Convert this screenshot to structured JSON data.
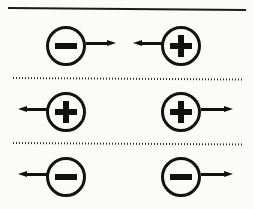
{
  "figure": {
    "background_color": "#fbfbfa",
    "ink_color": "#111111",
    "dividers": [
      {
        "style": "solid",
        "label": "top-solid-rule"
      },
      {
        "style": "dotted",
        "label": "dotted-rule-1"
      },
      {
        "style": "dotted",
        "label": "dotted-rule-2"
      }
    ],
    "rows": [
      {
        "id": "row-attraction",
        "interaction": "attraction",
        "left": {
          "charge": "negative",
          "sign_glyph": "−",
          "arrow_direction": "right",
          "arrow_side": "right-of-circle"
        },
        "right": {
          "charge": "positive",
          "sign_glyph": "+",
          "arrow_direction": "left",
          "arrow_side": "left-of-circle"
        }
      },
      {
        "id": "row-repulsion-positive",
        "interaction": "repulsion",
        "left": {
          "charge": "positive",
          "sign_glyph": "+",
          "arrow_direction": "left",
          "arrow_side": "left-of-circle"
        },
        "right": {
          "charge": "positive",
          "sign_glyph": "+",
          "arrow_direction": "right",
          "arrow_side": "right-of-circle"
        }
      },
      {
        "id": "row-repulsion-negative",
        "interaction": "repulsion",
        "left": {
          "charge": "negative",
          "sign_glyph": "−",
          "arrow_direction": "left",
          "arrow_side": "left-of-circle"
        },
        "right": {
          "charge": "negative",
          "sign_glyph": "−",
          "arrow_direction": "right",
          "arrow_side": "right-of-circle"
        }
      }
    ]
  }
}
